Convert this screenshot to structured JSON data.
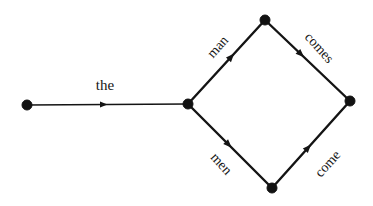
{
  "diagram": {
    "background_color": "#ffffff",
    "ink_color": "#141414",
    "node_radius": 5,
    "nodes": [
      {
        "id": "n0",
        "name": "start-node",
        "x": 27,
        "y": 105
      },
      {
        "id": "n1",
        "name": "branch-node",
        "x": 188,
        "y": 104
      },
      {
        "id": "n2",
        "name": "top-node",
        "x": 265,
        "y": 20
      },
      {
        "id": "n3",
        "name": "bottom-node",
        "x": 272,
        "y": 188
      },
      {
        "id": "n4",
        "name": "end-node",
        "x": 350,
        "y": 101
      }
    ],
    "edges": [
      {
        "id": "e-the",
        "name": "edge-the",
        "label": "the",
        "from": "n0",
        "to": "n1",
        "stroke_width": 1.6,
        "arrow_t": 0.5,
        "arrow_size": 7.5,
        "label_x": 105,
        "label_y": 85,
        "label_rotation": 0,
        "label_size": 15
      },
      {
        "id": "e-man",
        "name": "edge-man",
        "label": "man",
        "from": "n1",
        "to": "n2",
        "stroke_width": 2.4,
        "arrow_t": 0.6,
        "arrow_size": 8.5,
        "label_x": 218,
        "label_y": 47,
        "label_rotation": -48,
        "label_size": 14
      },
      {
        "id": "e-comes",
        "name": "edge-comes",
        "label": "comes",
        "from": "n2",
        "to": "n4",
        "stroke_width": 2.4,
        "arrow_t": 0.46,
        "arrow_size": 8.5,
        "label_x": 319,
        "label_y": 48,
        "label_rotation": 48,
        "label_size": 14
      },
      {
        "id": "e-men",
        "name": "edge-men",
        "label": "men",
        "from": "n1",
        "to": "n3",
        "stroke_width": 2.4,
        "arrow_t": 0.52,
        "arrow_size": 8.5,
        "label_x": 221,
        "label_y": 164,
        "label_rotation": 48,
        "label_size": 14
      },
      {
        "id": "e-come",
        "name": "edge-come",
        "label": "come",
        "from": "n3",
        "to": "n4",
        "stroke_width": 2.4,
        "arrow_t": 0.5,
        "arrow_size": 8.5,
        "label_x": 328,
        "label_y": 164,
        "label_rotation": -48,
        "label_size": 14
      }
    ]
  }
}
